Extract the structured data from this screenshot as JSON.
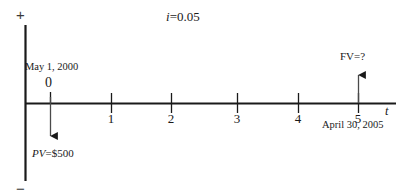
{
  "figure": {
    "kind": "cash-flow-time-line",
    "width": 408,
    "height": 196,
    "background": "#ffffff",
    "ink": "#1a1a1a"
  },
  "axes": {
    "vertical": {
      "plus_sign": "+",
      "minus_sign": "−",
      "x": 25,
      "top_y": 25,
      "bottom_y": 181
    },
    "horizontal": {
      "label": "t",
      "y": 103,
      "start_x": 25,
      "end_x": 396
    }
  },
  "interest": {
    "symbol": "i",
    "equals": "=",
    "value": "0.05",
    "full": "i=0.05"
  },
  "ticks": [
    {
      "label": "0",
      "x": 50,
      "show_number_below": false
    },
    {
      "label": "1",
      "x": 111,
      "show_number_below": true
    },
    {
      "label": "2",
      "x": 171,
      "show_number_below": true
    },
    {
      "label": "3",
      "x": 237,
      "show_number_below": true
    },
    {
      "label": "4",
      "x": 298,
      "show_number_below": true
    },
    {
      "label": "5",
      "x": 358,
      "show_number_below": true
    }
  ],
  "zero_marker": {
    "number": "0",
    "date": "May 1, 2000"
  },
  "end_marker": {
    "number": "5",
    "date": "April 30, 2005"
  },
  "cash_flows": [
    {
      "name": "present-value",
      "symbol": "PV",
      "equals": "=",
      "amount": "$500",
      "full": "PV=$500",
      "direction": "down",
      "at_tick": "0",
      "x": 50,
      "from_y": 103,
      "to_y": 144
    },
    {
      "name": "future-value",
      "symbol": "FV",
      "equals": "=",
      "amount": "?",
      "full": "FV=?",
      "direction": "up",
      "at_tick": "5",
      "x": 358,
      "from_y": 103,
      "to_y": 67
    }
  ]
}
